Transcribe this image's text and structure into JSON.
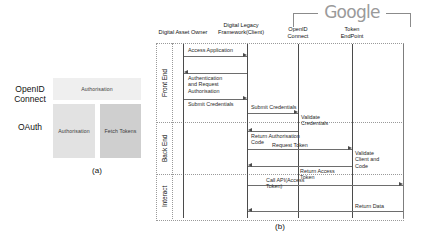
{
  "figure": {
    "panel_a": {
      "caption": "(a)",
      "rows": [
        {
          "label": "OpenID\nConnect",
          "name": "openid-connect"
        },
        {
          "label": "OAuth",
          "name": "oauth"
        }
      ],
      "boxes": [
        {
          "label": "Authorisation",
          "name": "oidc-authorisation",
          "color": "#efefef"
        },
        {
          "label": "Authorisation",
          "name": "oauth-authorisation",
          "color": "#e2e2e2"
        },
        {
          "label": "Fetch Tokens",
          "name": "oauth-fetch-tokens",
          "color": "#cfcfcf"
        }
      ]
    },
    "panel_b": {
      "caption": "(b)",
      "brand": "Google",
      "actors": [
        {
          "name": "digital-asset-owner",
          "label": "Digital Asset Owner"
        },
        {
          "name": "digital-legacy-framework-client",
          "label": "Digital Legacy\nFramework(Client)"
        },
        {
          "name": "openid-connect",
          "label": "OpenID\nConnect"
        },
        {
          "name": "token-endpoint",
          "label": "Token\nEndPoint"
        }
      ],
      "phases": [
        {
          "name": "front-end",
          "label": "Front End"
        },
        {
          "name": "back-end",
          "label": "Back End"
        },
        {
          "name": "interact",
          "label": "Interact"
        }
      ],
      "messages": [
        {
          "name": "access-application",
          "label": "Access Application"
        },
        {
          "name": "authentication-request",
          "label": "Authentication\nand Request\nAuthorisation"
        },
        {
          "name": "submit-credentials-owner",
          "label": "Submit Credentials"
        },
        {
          "name": "submit-credentials-oidc",
          "label": "Submit Credentials"
        },
        {
          "name": "validate-credentials",
          "label": "Validate\nCredentials"
        },
        {
          "name": "return-authorisation-code",
          "label": "Return Authorisation\nCode"
        },
        {
          "name": "request-token",
          "label": "Request Token"
        },
        {
          "name": "validate-client-and-code",
          "label": "Validate\nClient and\nCode"
        },
        {
          "name": "return-access-token",
          "label": "Return Access\nToken"
        },
        {
          "name": "call-api-access-token",
          "label": "Call API(Access\nToken)"
        },
        {
          "name": "return-data",
          "label": "Return Data"
        }
      ]
    }
  }
}
